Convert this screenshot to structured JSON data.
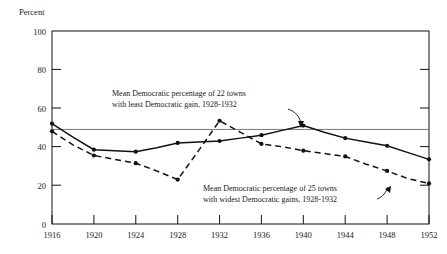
{
  "chart_data": {
    "type": "line",
    "title": "",
    "xlabel": "",
    "ylabel": "Percent",
    "ylim": [
      0,
      100
    ],
    "xlim": [
      1916,
      1952
    ],
    "yticks": [
      0,
      20,
      40,
      60,
      80,
      100
    ],
    "xticks": [
      1916,
      1920,
      1924,
      1928,
      1932,
      1936,
      1940,
      1944,
      1948,
      1952
    ],
    "ytick_labels": [
      "0",
      "20",
      "40",
      "60",
      "80",
      "100"
    ],
    "xtick_labels": [
      "1916",
      "1920",
      "1924",
      "1928",
      "1932",
      "1936",
      "1940",
      "1944",
      "1948",
      "1952"
    ],
    "grid": false,
    "legend_position": "inline-annotations",
    "reference_line": {
      "value": 49,
      "label": "",
      "style": "solid-gray"
    },
    "x": [
      1916,
      1918,
      1920,
      1922,
      1924,
      1926,
      1928,
      1930,
      1932,
      1934,
      1936,
      1938,
      1940,
      1942,
      1944,
      1946,
      1948,
      1950,
      1952
    ],
    "series": [
      {
        "name": "Mean Democratic percentage of 22 towns with least Democratic gain, 1928-1932",
        "style": "solid",
        "values": [
          52,
          45,
          38.5,
          38,
          37.5,
          39.5,
          42,
          42.5,
          43,
          44.5,
          46,
          48.5,
          51,
          47.5,
          44.5,
          42.5,
          40.5,
          37,
          33.5
        ]
      },
      {
        "name": "Mean Democratic percentage of 25 towns with widest Democratic gains, 1928-1932",
        "style": "dashed",
        "values": [
          48,
          41,
          35.5,
          33.5,
          31.5,
          27.5,
          23,
          38,
          53.5,
          47.5,
          41.5,
          40,
          38,
          36.5,
          35,
          31,
          27.5,
          23.5,
          21
        ]
      }
    ],
    "annotations": [
      {
        "id": "annotation-upper",
        "line1": "Mean Democratic percentage of 22 towns",
        "line2": "with least Democratic gain, 1928-1932",
        "points_to": {
          "x": 1940,
          "y": 51
        }
      },
      {
        "id": "annotation-lower",
        "line1": "Mean Democratic percentage of 25 towns",
        "line2": "with widest Democratic gains, 1928-1932",
        "points_to": {
          "x": 1948,
          "y": 22
        }
      }
    ],
    "colors": {
      "line": "#111111",
      "reference_line": "#666666",
      "frame": "#111111",
      "background": "#ffffff"
    }
  }
}
